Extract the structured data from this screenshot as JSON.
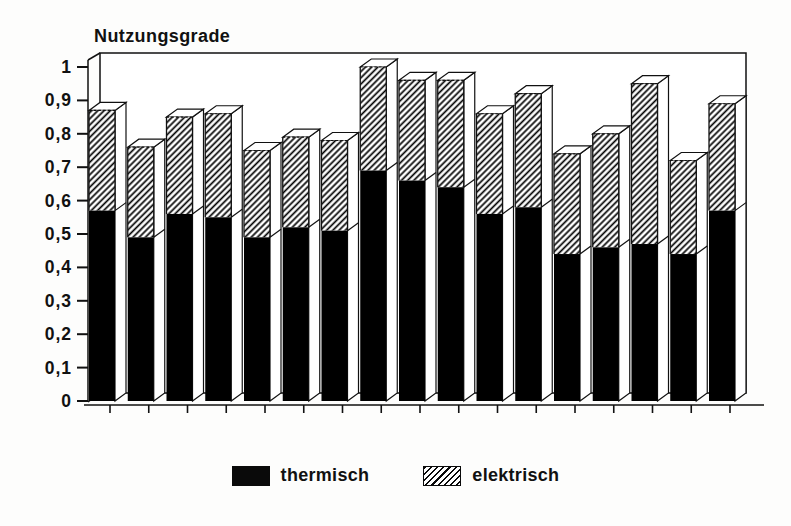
{
  "page": {
    "title": "Nutzungsgrade"
  },
  "chart_data": {
    "type": "bar",
    "stacked": true,
    "style": "3d-stacked-columns",
    "title": "Nutzungsgrade",
    "x_axis": {
      "labels_visible": false,
      "tick_count": 17
    },
    "y_axis": {
      "min": 0,
      "max": 1,
      "tick_step": 0.1,
      "tick_labels": [
        "1",
        "0,9",
        "0,8",
        "0,7",
        "0,6",
        "0,5",
        "0,4",
        "0,3",
        "0,2",
        "0,1",
        "0"
      ]
    },
    "series": [
      {
        "name": "thermisch",
        "style": "solid-black",
        "values": [
          0.57,
          0.49,
          0.56,
          0.55,
          0.49,
          0.52,
          0.51,
          0.69,
          0.66,
          0.64,
          0.56,
          0.58,
          0.44,
          0.46,
          0.47,
          0.44,
          0.57
        ]
      },
      {
        "name": "elektrisch",
        "style": "diagonal-hatch",
        "values": [
          0.3,
          0.27,
          0.29,
          0.31,
          0.26,
          0.27,
          0.27,
          0.31,
          0.3,
          0.32,
          0.3,
          0.34,
          0.3,
          0.34,
          0.48,
          0.28,
          0.32
        ]
      }
    ],
    "totals": [
      0.87,
      0.76,
      0.85,
      0.86,
      0.75,
      0.79,
      0.78,
      1.0,
      0.96,
      0.96,
      0.86,
      0.92,
      0.74,
      0.8,
      0.95,
      0.72,
      0.89
    ],
    "legend_position": "bottom-center",
    "grid": false,
    "colors": {
      "bar_fill": "#000000",
      "hatch_line": "#000000",
      "background": "#ffffff",
      "ink": "#111111"
    }
  },
  "legend": {
    "items": [
      {
        "label": "thermisch",
        "swatch": "solid-black"
      },
      {
        "label": "elektrisch",
        "swatch": "diagonal-hatch"
      }
    ]
  }
}
